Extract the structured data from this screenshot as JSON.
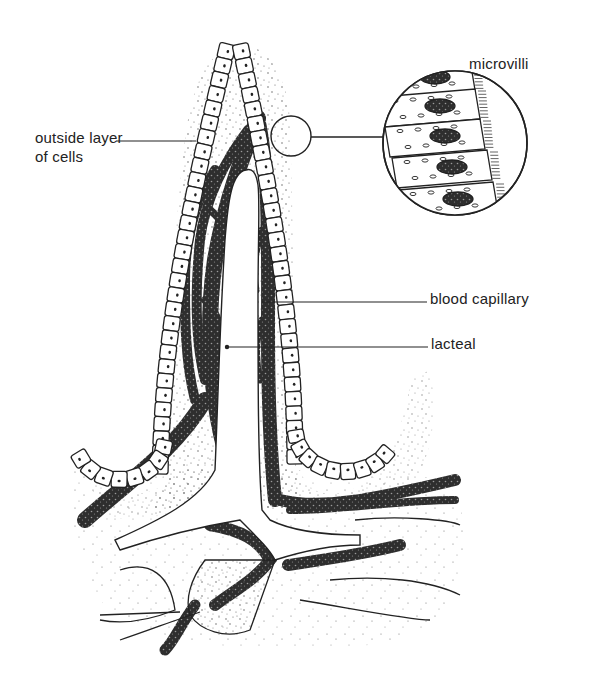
{
  "diagram": {
    "colors": {
      "ink": "#222222",
      "background": "#ffffff",
      "capillary_fill": "#3a3a3a",
      "stipple": "#555555"
    },
    "labels": {
      "outside_layer_line1": "outside layer",
      "outside_layer_line2": "of cells",
      "microvilli": "microvilli",
      "blood_capillary": "blood capillary",
      "lacteal": "lacteal"
    },
    "parts": [
      {
        "id": "outside-layer-of-cells",
        "label": "outside layer\nof cells"
      },
      {
        "id": "microvilli",
        "label": "microvilli",
        "shown_in": "magnified inset circle"
      },
      {
        "id": "blood-capillary",
        "label": "blood capillary"
      },
      {
        "id": "lacteal",
        "label": "lacteal"
      }
    ],
    "inset": {
      "description": "magnified view of epithelial cells with nuclei and microvilli border",
      "cell_count": 5
    }
  }
}
